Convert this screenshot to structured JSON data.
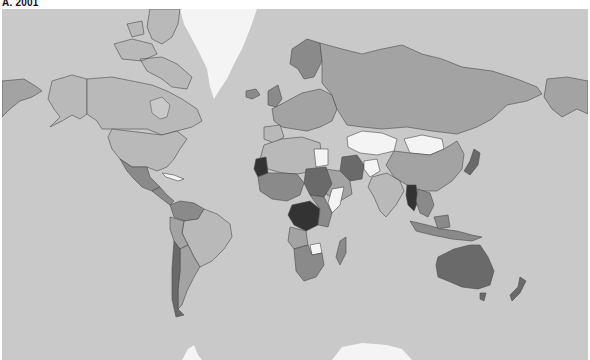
{
  "title": "A. 2001",
  "map": {
    "projection": "Mercator",
    "ocean_color": "#c9c9c9",
    "border_color": "#4a4a4a",
    "shades": {
      "white": "#f4f4f4",
      "very_light": "#dcdcdc",
      "light": "#b9b9b9",
      "medium": "#a3a3a3",
      "medium_dark": "#8a8a8a",
      "dark": "#6a6a6a",
      "very_dark": "#333333"
    },
    "regions": [
      {
        "name": "Greenland",
        "shade": "white"
      },
      {
        "name": "Canada",
        "shade": "light"
      },
      {
        "name": "Alaska",
        "shade": "light"
      },
      {
        "name": "United States",
        "shade": "light"
      },
      {
        "name": "Mexico",
        "shade": "medium_dark"
      },
      {
        "name": "Cuba",
        "shade": "white"
      },
      {
        "name": "Central America",
        "shade": "medium_dark"
      },
      {
        "name": "Brazil",
        "shade": "light"
      },
      {
        "name": "Venezuela",
        "shade": "medium_dark"
      },
      {
        "name": "Colombia",
        "shade": "medium_dark"
      },
      {
        "name": "Peru",
        "shade": "medium"
      },
      {
        "name": "Bolivia",
        "shade": "light"
      },
      {
        "name": "Argentina",
        "shade": "medium"
      },
      {
        "name": "Chile",
        "shade": "dark"
      },
      {
        "name": "Paraguay",
        "shade": "medium_dark"
      },
      {
        "name": "Uruguay",
        "shade": "light"
      },
      {
        "name": "Russia",
        "shade": "medium"
      },
      {
        "name": "Kazakhstan",
        "shade": "white"
      },
      {
        "name": "Mongolia",
        "shade": "white"
      },
      {
        "name": "China",
        "shade": "medium"
      },
      {
        "name": "India",
        "shade": "light"
      },
      {
        "name": "Iran",
        "shade": "dark"
      },
      {
        "name": "Afghanistan",
        "shade": "white"
      },
      {
        "name": "Myanmar",
        "shade": "very_dark"
      },
      {
        "name": "Japan",
        "shade": "dark"
      },
      {
        "name": "Indonesia",
        "shade": "medium_dark"
      },
      {
        "name": "Australia",
        "shade": "dark"
      },
      {
        "name": "New Zealand",
        "shade": "dark"
      },
      {
        "name": "Mauritania",
        "shade": "very_dark"
      },
      {
        "name": "Algeria",
        "shade": "light"
      },
      {
        "name": "Libya",
        "shade": "medium"
      },
      {
        "name": "Egypt",
        "shade": "white"
      },
      {
        "name": "Sudan",
        "shade": "dark"
      },
      {
        "name": "DR Congo",
        "shade": "very_dark"
      },
      {
        "name": "Somalia",
        "shade": "white"
      },
      {
        "name": "Zimbabwe",
        "shade": "white"
      },
      {
        "name": "Madagascar",
        "shade": "medium_dark"
      },
      {
        "name": "South Africa",
        "shade": "medium_dark"
      },
      {
        "name": "Saudi Arabia",
        "shade": "medium"
      },
      {
        "name": "Scandinavia",
        "shade": "medium_dark"
      },
      {
        "name": "Europe",
        "shade": "medium"
      },
      {
        "name": "Antarctica",
        "shade": "white"
      }
    ]
  }
}
